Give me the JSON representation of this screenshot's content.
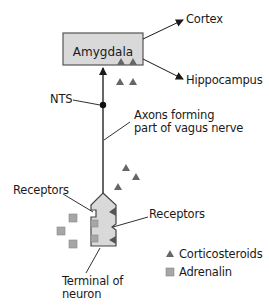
{
  "diagram": {
    "box": {
      "label": "Amygdala",
      "fill": "#d9d9d9",
      "stroke": "#555555"
    },
    "labels": {
      "cortex": "Cortex",
      "hippocampus": "Hippocampus",
      "nts": "NTS",
      "axons_line1": "Axons forming",
      "axons_line2": "part of vagus nerve",
      "receptors_left": "Receptors",
      "receptors_right": "Receptors",
      "terminal_line1": "Terminal of",
      "terminal_line2": "neuron"
    },
    "legend": [
      {
        "symbol": "triangle",
        "label": "Corticosteroids",
        "color": "#666666"
      },
      {
        "symbol": "square",
        "label": "Adrenalin",
        "color": "#a6a6a6"
      }
    ],
    "colors": {
      "line": "#333333",
      "terminal_fill": "#d9d9d9",
      "triangle": "#666666",
      "square": "#a6a6a6"
    }
  }
}
